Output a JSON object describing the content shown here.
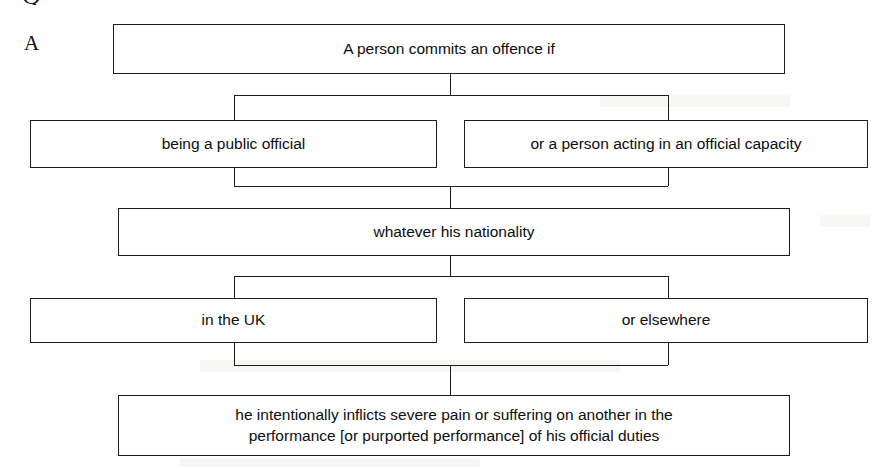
{
  "figure": {
    "panel_letter": "A",
    "clipped_glyph_above": "Q",
    "ink_color": "#1d1d1d",
    "background_color": "#ffffff"
  },
  "flow": {
    "nodes": [
      {
        "id": "offence-condition",
        "label": "A person commits an offence if",
        "row": 1,
        "span": "full"
      },
      {
        "id": "public-official",
        "label": "being a public official",
        "row": 2,
        "span": "left"
      },
      {
        "id": "official-capacity",
        "label": "or a person acting in an official capacity",
        "row": 2,
        "span": "right"
      },
      {
        "id": "nationality",
        "label": "whatever his nationality",
        "row": 3,
        "span": "full"
      },
      {
        "id": "in-the-uk",
        "label": "in the UK",
        "row": 4,
        "span": "left"
      },
      {
        "id": "or-elsewhere",
        "label": "or elsewhere",
        "row": 4,
        "span": "right"
      },
      {
        "id": "severe-pain",
        "label": "he intentionally inflicts severe pain or suffering on another in the\nperformance [or purported performance] of his official duties",
        "row": 5,
        "span": "full"
      }
    ]
  }
}
